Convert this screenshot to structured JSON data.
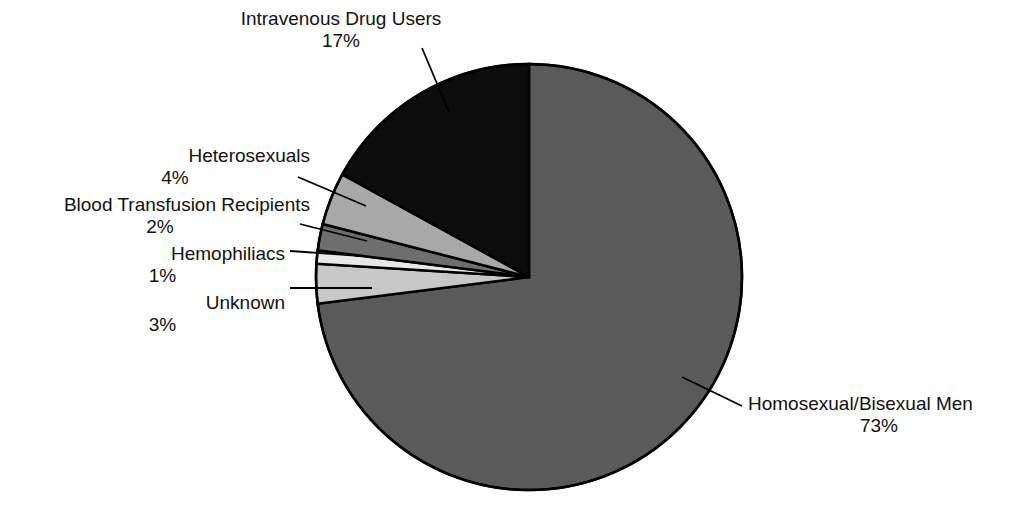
{
  "chart_data": {
    "type": "pie",
    "title": "",
    "subtitle": "",
    "xlabel": "",
    "ylabel": "",
    "legend_position": "none",
    "grid": false,
    "units": "percent",
    "total": 100,
    "start_angle_deg": 0,
    "direction": "clockwise",
    "categories": [
      "Homosexual/Bisexual Men",
      "Unknown",
      "Hemophiliacs",
      "Blood Transfusion Recipients",
      "Heterosexuals",
      "Intravenous Drug Users"
    ],
    "values": [
      73,
      3,
      1,
      2,
      4,
      17
    ],
    "slices": [
      {
        "id": "homosexual-bisexual-men",
        "label": "Homosexual/Bisexual Men",
        "percent_text": "73%",
        "value": 73,
        "color": "#5a5a5a",
        "label_align": "left",
        "leader": {
          "x1": 682,
          "y1": 377,
          "x2": 742,
          "y2": 406
        }
      },
      {
        "id": "unknown",
        "label": "Unknown",
        "percent_text": "3%",
        "value": 3,
        "color": "#c8c8c8",
        "label_align": "center",
        "leader": {
          "x1": 372,
          "y1": 288,
          "x2": 290,
          "y2": 288
        }
      },
      {
        "id": "hemophiliacs",
        "label": "Hemophiliacs",
        "percent_text": "1%",
        "value": 1,
        "color": "#e8e8e8",
        "label_align": "center",
        "leader": {
          "x1": 362,
          "y1": 256,
          "x2": 290,
          "y2": 251
        }
      },
      {
        "id": "blood-transfusion-recipients",
        "label": "Blood Transfusion Recipients",
        "percent_text": "2%",
        "value": 2,
        "color": "#6e6e6e",
        "label_align": "center",
        "leader": {
          "x1": 367,
          "y1": 241,
          "x2": 300,
          "y2": 224
        }
      },
      {
        "id": "heterosexuals",
        "label": "Heterosexuals",
        "percent_text": "4%",
        "value": 4,
        "color": "#a8a8a8",
        "label_align": "center",
        "leader": {
          "x1": 366,
          "y1": 206,
          "x2": 298,
          "y2": 177
        }
      },
      {
        "id": "intravenous-drug-users",
        "label": "Intravenous Drug Users",
        "percent_text": "17%",
        "value": 17,
        "color": "#0d0d0d",
        "label_align": "center",
        "leader": {
          "x1": 449,
          "y1": 112,
          "x2": 422,
          "y2": 48
        }
      }
    ],
    "geometry": {
      "center_x": 529,
      "center_y": 277,
      "radius": 213,
      "outline_color": "#000000",
      "outline_width": 2.5,
      "background": "#ffffff"
    }
  },
  "labels": {
    "intravenous_drug_users": {
      "name": "Intravenous Drug Users",
      "percent": "17%"
    },
    "heterosexuals": {
      "name": "Heterosexuals",
      "percent": "4%"
    },
    "blood_transfusion_recipients": {
      "name": "Blood Transfusion Recipients",
      "percent": "2%"
    },
    "hemophiliacs": {
      "name": "Hemophiliacs",
      "percent": "1%"
    },
    "unknown": {
      "name": "Unknown",
      "percent": "3%"
    },
    "homosexual_bisexual_men": {
      "name": "Homosexual/Bisexual Men",
      "percent": "73%"
    }
  }
}
